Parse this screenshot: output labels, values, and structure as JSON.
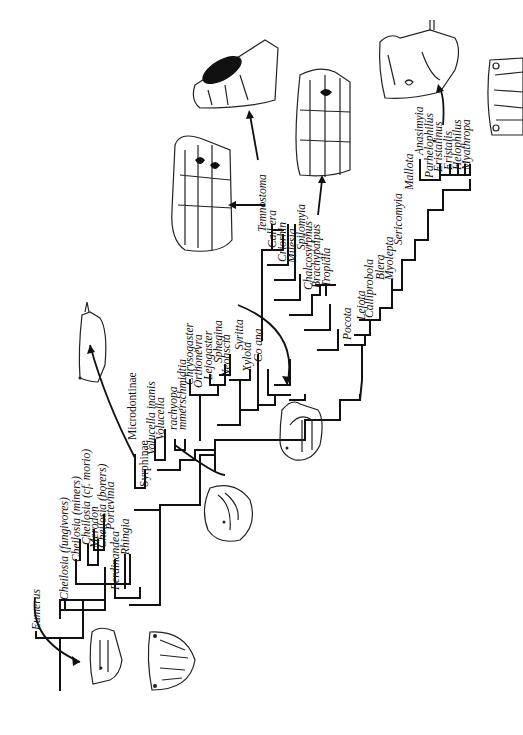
{
  "figure": {
    "type": "cladogram",
    "orientation": "rotated-90",
    "taxa": {
      "eumerus": "Eumerus",
      "cheilosia_fungivores": "Cheilosia (fungivores)",
      "cheilosia_miners": "Cheilosia (miners)",
      "cheilosia_morio": "Cheilosia (cf. morio)",
      "merodon": "Merodon",
      "cheilosia_borers": "Cheilosia (borers)",
      "portevinia": "Portevinia",
      "ferdinandea": "Ferdinandea",
      "rhingia": "Rhingia",
      "syrphinae": "Syrphinae",
      "microdontinae": "Microdontinae",
      "volucella_inanis": "Volucella inanis",
      "volucella": "Volucella",
      "trachyopa": "rachyopa",
      "hammerschmidtia": "mmerschmidtia",
      "chrysogaster": "Chrysogaster",
      "orthonevra": "Orthonevra",
      "lejogaster": "Lejogaster",
      "sphegina": "Sphegina",
      "neoascia": "Neoascia",
      "syritta": "Syritta",
      "xylota": "Xylota",
      "ceriana": "Co    ana",
      "temnostoma": "Temnostoma",
      "callicera": "Call   era",
      "criorhina": "Criorhin",
      "milesia": "Milesia",
      "spilomyia": "Spilomyia",
      "chalcosyrphus": "Chalcosyrphus",
      "brachypalpus": "Brachypalpus",
      "tropidia": "Tropidia",
      "pocota": "Pocota",
      "lejota": "Lejota",
      "calliprobola": "Calliprobola",
      "blera": "Blera",
      "myolepta": "Myolepta",
      "sericomyia": "Sericomyia",
      "mallota": "Mallota",
      "anasimyia": "Anasimyia",
      "parhelophilus": "Parhelophilus",
      "eristalinus": "Eristalinus",
      "eristalis": "Eristalis",
      "helophilus": "Helophilus",
      "myathropa": "Myathropa"
    },
    "illustrations": [
      "larva-eumerus-lateral",
      "larva-eumerus-posterior",
      "larva-syrphinae",
      "larva-volucella",
      "larva-ceriana",
      "larva-callicera",
      "larva-temnostoma",
      "larva-brachypalpus",
      "larva-eristalis-lateral",
      "larva-eristalis-posterior"
    ],
    "colors": {
      "ink": "#111111",
      "background": "#ffffff"
    }
  }
}
